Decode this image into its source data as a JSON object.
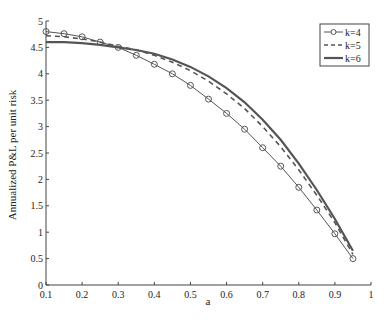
{
  "chart_data": {
    "type": "line",
    "title": "",
    "xlabel": "a",
    "ylabel": "Annualized P&L per unit risk",
    "xlim": [
      0.1,
      1
    ],
    "ylim": [
      0,
      5
    ],
    "grid": false,
    "legend_position": "upper right",
    "xticks": [
      "0.1",
      "0.2",
      "0.3",
      "0.4",
      "0.5",
      "0.6",
      "0.7",
      "0.8",
      "0.9",
      "1"
    ],
    "yticks": [
      "0",
      "0.5",
      "1",
      "1.5",
      "2",
      "2.5",
      "3",
      "3.5",
      "4",
      "4.5",
      "5"
    ],
    "x": [
      0.1,
      0.15,
      0.2,
      0.25,
      0.3,
      0.35,
      0.4,
      0.45,
      0.5,
      0.55,
      0.6,
      0.65,
      0.7,
      0.75,
      0.8,
      0.85,
      0.9,
      0.95
    ],
    "series": [
      {
        "name": "k=4",
        "style": "solid-circle-markers",
        "values": [
          4.8,
          4.76,
          4.7,
          4.6,
          4.5,
          4.35,
          4.18,
          4.0,
          3.78,
          3.52,
          3.25,
          2.95,
          2.6,
          2.25,
          1.85,
          1.42,
          0.97,
          0.5
        ]
      },
      {
        "name": "k=5",
        "style": "dashed",
        "values": [
          4.72,
          4.7,
          4.66,
          4.6,
          4.52,
          4.45,
          4.35,
          4.22,
          4.06,
          3.86,
          3.62,
          3.34,
          3.0,
          2.62,
          2.18,
          1.7,
          1.18,
          0.58
        ]
      },
      {
        "name": "k=6",
        "style": "solid-thick",
        "values": [
          4.6,
          4.6,
          4.58,
          4.55,
          4.5,
          4.45,
          4.38,
          4.27,
          4.13,
          3.95,
          3.73,
          3.46,
          3.13,
          2.75,
          2.3,
          1.8,
          1.25,
          0.65
        ]
      }
    ]
  }
}
